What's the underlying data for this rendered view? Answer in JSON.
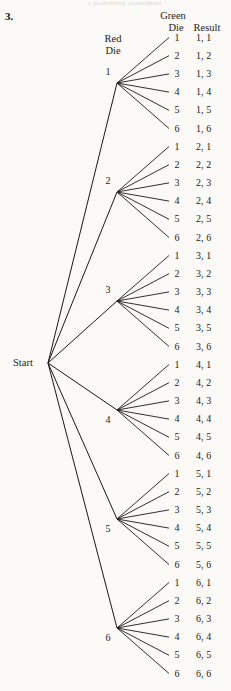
{
  "page": {
    "top_partial_text": "a probability experiment",
    "problem_number": "3.",
    "background_color": "#fbfaf7",
    "ink_color": "#181818"
  },
  "headers": {
    "red_die_line1": "Red",
    "red_die_line2": "Die",
    "green_die_line1": "Green",
    "green_die_line2": "Die",
    "result": "Result"
  },
  "tree": {
    "type": "probability-tree",
    "root_label": "Start",
    "first_stage_name": "Red Die",
    "second_stage_name": "Green Die",
    "outcome_name": "Result",
    "branches": [
      {
        "red": "1",
        "outcomes": [
          {
            "green": "1",
            "result": "1, 1"
          },
          {
            "green": "2",
            "result": "1, 2"
          },
          {
            "green": "3",
            "result": "1, 3"
          },
          {
            "green": "4",
            "result": "1, 4"
          },
          {
            "green": "5",
            "result": "1, 5"
          },
          {
            "green": "6",
            "result": "1, 6"
          }
        ]
      },
      {
        "red": "2",
        "outcomes": [
          {
            "green": "1",
            "result": "2, 1"
          },
          {
            "green": "2",
            "result": "2, 2"
          },
          {
            "green": "3",
            "result": "2, 3"
          },
          {
            "green": "4",
            "result": "2, 4"
          },
          {
            "green": "5",
            "result": "2, 5"
          },
          {
            "green": "6",
            "result": "2, 6"
          }
        ]
      },
      {
        "red": "3",
        "outcomes": [
          {
            "green": "1",
            "result": "3, 1"
          },
          {
            "green": "2",
            "result": "3, 2"
          },
          {
            "green": "3",
            "result": "3, 3"
          },
          {
            "green": "4",
            "result": "3, 4"
          },
          {
            "green": "5",
            "result": "3, 5"
          },
          {
            "green": "6",
            "result": "3, 6"
          }
        ]
      },
      {
        "red": "4",
        "outcomes": [
          {
            "green": "1",
            "result": "4, 1"
          },
          {
            "green": "2",
            "result": "4, 2"
          },
          {
            "green": "3",
            "result": "4, 3"
          },
          {
            "green": "4",
            "result": "4, 4"
          },
          {
            "green": "5",
            "result": "4, 5"
          },
          {
            "green": "6",
            "result": "4, 6"
          }
        ]
      },
      {
        "red": "5",
        "outcomes": [
          {
            "green": "1",
            "result": "5, 1"
          },
          {
            "green": "2",
            "result": "5, 2"
          },
          {
            "green": "3",
            "result": "5, 3"
          },
          {
            "green": "4",
            "result": "5, 4"
          },
          {
            "green": "5",
            "result": "5, 5"
          },
          {
            "green": "6",
            "result": "5, 6"
          }
        ]
      },
      {
        "red": "6",
        "outcomes": [
          {
            "green": "1",
            "result": "6, 1"
          },
          {
            "green": "2",
            "result": "6, 2"
          },
          {
            "green": "3",
            "result": "6, 3"
          },
          {
            "green": "4",
            "result": "6, 4"
          },
          {
            "green": "5",
            "result": "6, 5"
          },
          {
            "green": "6",
            "result": "6, 6"
          }
        ]
      }
    ]
  },
  "geometry": {
    "start_x": 48,
    "start_y": 363,
    "node_x": 117,
    "group_first_node_y": 83,
    "group_pitch": 109,
    "row_pitch": 18.2,
    "green_label_x": 177,
    "result_label_x": 196,
    "leaf_tip_x": 169
  }
}
